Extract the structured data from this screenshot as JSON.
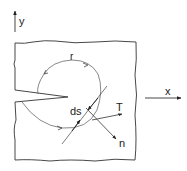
{
  "diagram": {
    "type": "j-integral-contour",
    "labels": {
      "y_axis": "y",
      "x_axis": "x",
      "contour": "r",
      "arc_length": "ds",
      "traction": "T",
      "normal": "n"
    },
    "colors": {
      "stroke": "#333333",
      "background": "#ffffff"
    }
  }
}
